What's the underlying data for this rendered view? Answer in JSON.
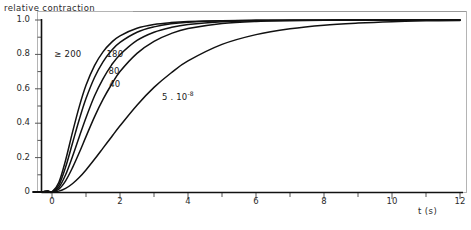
{
  "chart_data": {
    "type": "line",
    "title": "",
    "ylabel": "relative contraction",
    "xlabel": "t (s)",
    "xlim": [
      -0.6,
      12
    ],
    "ylim": [
      0,
      1.05
    ],
    "xticks": [
      "0",
      "2",
      "4",
      "6",
      "8",
      "10",
      "12"
    ],
    "xtick_values": [
      0,
      2,
      4,
      6,
      8,
      10,
      12
    ],
    "yticks": [
      "0",
      "0.2",
      "0.4",
      "0.6",
      "0.8",
      "1.0"
    ],
    "ytick_values": [
      0,
      0.2,
      0.4,
      0.6,
      0.8,
      1.0
    ],
    "grid": false,
    "legend_position": "inline-curve-labels",
    "reference_line_y": 1.0,
    "series": [
      {
        "name": "≥ 200",
        "label": "≥ 200",
        "label_x": 0.95,
        "label_y": 0.795,
        "tau": 0.62,
        "x": [
          0,
          0.2,
          0.4,
          0.6,
          0.8,
          1.0,
          1.25,
          1.5,
          1.75,
          2.0,
          2.5,
          3.0,
          3.5,
          4.0,
          5.0,
          6.0,
          7.0,
          8.0,
          9.0,
          10.0,
          11.0,
          12.0
        ],
        "values": [
          0,
          0.055,
          0.185,
          0.345,
          0.495,
          0.62,
          0.735,
          0.815,
          0.87,
          0.908,
          0.952,
          0.974,
          0.985,
          0.991,
          0.996,
          0.998,
          0.999,
          0.999,
          1.0,
          1.0,
          1.0,
          1.0
        ]
      },
      {
        "name": "180",
        "label": "180",
        "label_x": 1.72,
        "label_y": 0.795,
        "tau": 0.74,
        "x": [
          0,
          0.2,
          0.4,
          0.6,
          0.8,
          1.0,
          1.25,
          1.5,
          1.75,
          2.0,
          2.5,
          3.0,
          3.5,
          4.0,
          5.0,
          6.0,
          7.0,
          8.0,
          9.0,
          10.0,
          11.0,
          12.0
        ],
        "values": [
          0,
          0.04,
          0.145,
          0.282,
          0.42,
          0.543,
          0.666,
          0.757,
          0.823,
          0.87,
          0.929,
          0.96,
          0.978,
          0.987,
          0.995,
          0.998,
          0.999,
          0.999,
          1.0,
          1.0,
          1.0,
          1.0
        ]
      },
      {
        "name": "80",
        "label": "80",
        "label_x": 1.78,
        "label_y": 0.7,
        "tau": 0.92,
        "x": [
          0,
          0.2,
          0.4,
          0.6,
          0.8,
          1.0,
          1.25,
          1.5,
          1.75,
          2.0,
          2.5,
          3.0,
          3.5,
          4.0,
          5.0,
          6.0,
          7.0,
          8.0,
          9.0,
          10.0,
          11.0,
          12.0
        ],
        "values": [
          0,
          0.026,
          0.1,
          0.205,
          0.32,
          0.432,
          0.558,
          0.658,
          0.738,
          0.798,
          0.881,
          0.929,
          0.957,
          0.974,
          0.99,
          0.996,
          0.998,
          0.999,
          1.0,
          1.0,
          1.0,
          1.0
        ]
      },
      {
        "name": "40",
        "label": "40",
        "label_x": 1.8,
        "label_y": 0.625,
        "tau": 1.15,
        "x": [
          0,
          0.2,
          0.4,
          0.6,
          0.8,
          1.0,
          1.25,
          1.5,
          1.75,
          2.0,
          2.5,
          3.0,
          3.5,
          4.0,
          5.0,
          6.0,
          7.0,
          8.0,
          9.0,
          10.0,
          11.0,
          12.0
        ],
        "values": [
          0,
          0.016,
          0.065,
          0.14,
          0.228,
          0.322,
          0.437,
          0.538,
          0.625,
          0.7,
          0.806,
          0.876,
          0.921,
          0.95,
          0.98,
          0.992,
          0.996,
          0.998,
          0.999,
          1.0,
          1.0,
          1.0
        ]
      },
      {
        "name": "5.10-8",
        "label_prefix": "5 . 10",
        "label_exponent": "-8",
        "label_x": 3.35,
        "label_y": 0.545,
        "tau": 1.95,
        "x": [
          0,
          0.2,
          0.4,
          0.6,
          0.8,
          1.0,
          1.25,
          1.5,
          1.75,
          2.0,
          2.5,
          3.0,
          3.5,
          4.0,
          5.0,
          6.0,
          7.0,
          8.0,
          9.0,
          10.0,
          11.0,
          12.0
        ],
        "values": [
          0,
          0.005,
          0.021,
          0.048,
          0.084,
          0.128,
          0.19,
          0.255,
          0.32,
          0.385,
          0.505,
          0.608,
          0.692,
          0.762,
          0.858,
          0.915,
          0.949,
          0.97,
          0.982,
          0.99,
          0.995,
          0.997
        ]
      }
    ]
  },
  "axes": {
    "frame_color": "#b4b4b4",
    "line_color": "#111111",
    "tick_color": "#555555"
  }
}
